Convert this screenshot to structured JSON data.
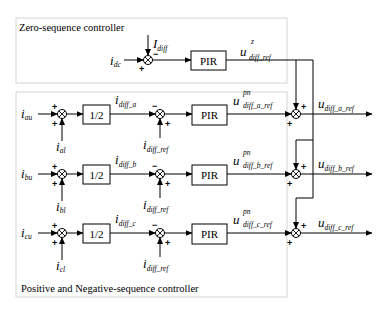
{
  "colors": {
    "line": "#000000",
    "frame": "#d4d4d4",
    "background": "#ffffff"
  },
  "zero_sequence": {
    "title": "Zero-sequence controller",
    "input": {
      "main": "i",
      "sub": "dc"
    },
    "feedback": {
      "main": "I",
      "sub": "diff"
    },
    "signs": {
      "input": "+",
      "feedback": "−"
    },
    "block": "PIR",
    "output": {
      "main": "u",
      "sup": "z",
      "sub": "diff_ref"
    }
  },
  "pos_neg_sequence": {
    "title": "Positive and Negative-sequence controller",
    "phases": [
      {
        "upper_input": {
          "main": "i",
          "sub": "au"
        },
        "lower_input": {
          "main": "i",
          "sub": "al"
        },
        "gain": "1/2",
        "diff": {
          "main": "i",
          "sub": "diff_a"
        },
        "ref": {
          "main": "i",
          "sub": "diff_ref"
        },
        "block": "PIR",
        "pn_out": {
          "main": "u",
          "sup": "pn",
          "sub": "diff_a_ref"
        },
        "final_out": {
          "main": "u",
          "sub": "diff_a_ref"
        },
        "signs": {
          "sum1_top": "+",
          "sum1_bottom": "+",
          "sum2_diff": "−",
          "sum2_ref": "+",
          "sum3_top": "+",
          "sum3_left": "+"
        }
      },
      {
        "upper_input": {
          "main": "i",
          "sub": "bu"
        },
        "lower_input": {
          "main": "i",
          "sub": "bl"
        },
        "gain": "1/2",
        "diff": {
          "main": "i",
          "sub": "diff_b"
        },
        "ref": {
          "main": "i",
          "sub": "diff_ref"
        },
        "block": "PIR",
        "pn_out": {
          "main": "u",
          "sup": "pn",
          "sub": "diff_b_ref"
        },
        "final_out": {
          "main": "u",
          "sub": "diff_b_ref"
        },
        "signs": {
          "sum1_top": "+",
          "sum1_bottom": "+",
          "sum2_diff": "−",
          "sum2_ref": "+",
          "sum3_top": "+",
          "sum3_left": "+"
        }
      },
      {
        "upper_input": {
          "main": "i",
          "sub": "cu"
        },
        "lower_input": {
          "main": "i",
          "sub": "cl"
        },
        "gain": "1/2",
        "diff": {
          "main": "i",
          "sub": "diff_c"
        },
        "ref": {
          "main": "i",
          "sub": "diff_ref"
        },
        "block": "PIR",
        "pn_out": {
          "main": "u",
          "sup": "pn",
          "sub": "diff_c_ref"
        },
        "final_out": {
          "main": "u",
          "sub": "diff_c_ref"
        },
        "signs": {
          "sum1_top": "+",
          "sum1_bottom": "+",
          "sum2_diff": "−",
          "sum2_ref": "+",
          "sum3_top": "+",
          "sum3_left": "+"
        }
      }
    ]
  }
}
